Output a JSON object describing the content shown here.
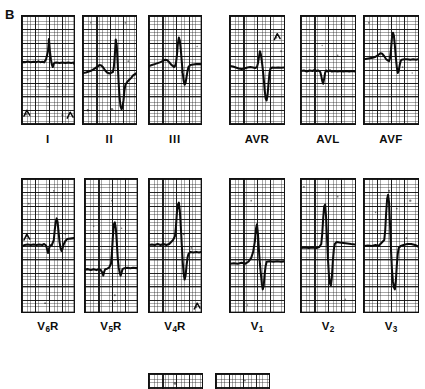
{
  "figure": {
    "panel_letter": "B",
    "background_color": "#ffffff",
    "ink_color": "#0b0b0b",
    "grid_major_color": "#111111",
    "grid_minor_color": "#282828",
    "width": 425,
    "height": 389,
    "caption_note": "Twelve-lead electrocardiogram strips, panel B"
  },
  "grid": {
    "major_cell_px": 13.4,
    "minor_cell_px": 2.7,
    "major_columns": 4,
    "major_rows": 8
  },
  "rows": [
    {
      "row_name": "standard-and-augmented-leads",
      "groups": [
        {
          "group_name": "standard-limb-leads",
          "panels": [
            {
              "id": "lead-I",
              "label": "I",
              "label_kind": "roman",
              "x": 21,
              "y": 15,
              "width": 54,
              "height": 110,
              "label_x": 21,
              "label_y": 133,
              "label_width": 54,
              "clipped": false,
              "trace": "M0,47 L3,47 L6,46.4 L9,47.2 L12,46.6 L15,47 L17,46.2 L19,47 L21,46.6 L23,47.2 L25,44 L26,40 L27,36 L28,23.5 L29,36 L30,44 L31,49.5 L32,52 L33,48.6 L34,47.6 L36,47.4 L39,47.8 L42,47.4 L45,47.8 L48,47.4 L51,47.8 L54,47.4 L54,47.8 L54,48.6 L54,48.6",
              "artifacts": [
                {
                  "cx": 4,
                  "cy": 100,
                  "r": 1.3
                },
                {
                  "cx": 42,
                  "cy": 101,
                  "r": 1.1
                },
                {
                  "cx": 6,
                  "cy": 65,
                  "r": 0.8
                },
                {
                  "cx": 27,
                  "cy": 72,
                  "r": 0.9
                }
              ],
              "corner_marks": [
                {
                  "type": "tick-bottom-left",
                  "x": 2,
                  "y": 96
                },
                {
                  "type": "tick-bottom-right",
                  "x": 47,
                  "y": 98
                }
              ]
            },
            {
              "id": "lead-II",
              "label": "II",
              "label_kind": "roman",
              "x": 82,
              "y": 15,
              "width": 55,
              "height": 110,
              "label_x": 82,
              "label_y": 133,
              "label_width": 55,
              "clipped": false,
              "trace": "M0,58 L3,57.5 L6,56.5 L9,55.5 L12,53.5 L15,51.5 L17,50 L19,50.5 L21,52.5 L23,55.5 L25,57.5 L27,58.5 L29,58 L31,57 L32,52 L33,40 L34,24 L35,30 L36,48 L37,68 L38,84 L39,92 L40,95 L41,93 L42,86 L43,76 L44,70 L46,67 L48,65 L50,63 L52,60.5 L55,58.5",
              "artifacts": [
                {
                  "cx": 5,
                  "cy": 96,
                  "r": 1.2
                },
                {
                  "cx": 30,
                  "cy": 95,
                  "r": 1.4
                },
                {
                  "cx": 47,
                  "cy": 46,
                  "r": 0.9
                },
                {
                  "cx": 8,
                  "cy": 7,
                  "r": 0.8
                },
                {
                  "cx": 44,
                  "cy": 7,
                  "r": 1.0
                }
              ],
              "corner_marks": []
            },
            {
              "id": "lead-III",
              "label": "III",
              "label_kind": "roman",
              "x": 148,
              "y": 15,
              "width": 54,
              "height": 110,
              "label_x": 148,
              "label_y": 133,
              "label_width": 54,
              "clipped": false,
              "trace": "M0,51 L3,50 L6,49 L9,48 L12,47 L15,45.5 L17,44.5 L19,45 L21,47 L23,49.5 L25,51 L26,52 L27,51 L28,48 L29,40 L30,28 L31,22 L32,25 L33,34 L34,46 L35,58 L36,66 L37,70 L38,68 L39,62 L40,56 L41,52 L43,50 L46,49.5 L49,49 L52,49 L54,49",
              "artifacts": [
                {
                  "cx": 34,
                  "cy": 57,
                  "r": 1.0
                },
                {
                  "cx": 42,
                  "cy": 56,
                  "r": 0.9
                },
                {
                  "cx": 50,
                  "cy": 31,
                  "r": 0.8
                }
              ],
              "corner_marks": []
            }
          ]
        },
        {
          "group_name": "augmented-limb-leads",
          "panels": [
            {
              "id": "lead-AVR",
              "label": "AVR",
              "label_kind": "plain",
              "x": 229,
              "y": 15,
              "width": 56,
              "height": 110,
              "label_x": 229,
              "label_y": 133,
              "label_width": 56,
              "clipped": false,
              "trace": "M0,51 L3,51.5 L6,52.5 L9,53.5 L12,54 L15,53.5 L18,52.5 L21,52 L24,52.5 L26,53 L28,52 L29,48 L30,42 L31,36 L32,39 L33,46 L34,54 L35,64 L36,76 L37,84 L38,86 L39,80 L40,68 L41,58 L42,53.5 L44,52.5 L47,52.8 L50,52.4 L53,52.8 L56,52.4",
              "artifacts": [
                {
                  "cx": 48,
                  "cy": 22,
                  "r": 1.1
                },
                {
                  "cx": 53,
                  "cy": 36,
                  "r": 1.0
                },
                {
                  "cx": 15,
                  "cy": 66,
                  "r": 0.8
                }
              ],
              "corner_marks": [
                {
                  "type": "tick-upper-right",
                  "x": 46,
                  "y": 18
                }
              ]
            },
            {
              "id": "lead-AVL",
              "label": "AVL",
              "label_kind": "plain",
              "x": 300,
              "y": 15,
              "width": 56,
              "height": 110,
              "label_x": 300,
              "label_y": 133,
              "label_width": 56,
              "clipped": false,
              "trace": "M0,56 L3,55.5 L6,56.5 L9,55.5 L12,56 L14,55 L16,56 L18,55.5 L20,57 L21,61 L22,66 L23,69 L24,64 L25,58 L26,55.5 L28,56.5 L30,55.5 L32,56.5 L35,56 L38,56.5 L41,56 L44,56.5 L47,56 L50,56.5 L53,56 L56,56.4",
              "artifacts": [
                {
                  "cx": 42,
                  "cy": 8,
                  "r": 0.9
                },
                {
                  "cx": 38,
                  "cy": 40,
                  "r": 0.8
                },
                {
                  "cx": 22,
                  "cy": 30,
                  "r": 0.7
                }
              ],
              "corner_marks": []
            },
            {
              "id": "lead-AVF",
              "label": "AVF",
              "label_kind": "plain",
              "x": 363,
              "y": 15,
              "width": 56,
              "height": 110,
              "label_x": 363,
              "label_y": 133,
              "label_width": 56,
              "clipped": false,
              "trace": "M0,44 L3,43.5 L6,43 L9,42.5 L12,41.5 L15,39.5 L17,38 L19,38.5 L21,41 L23,44 L25,45.5 L26,46 L27,43 L28,34 L29,22 L30,17 L31,20 L32,30 L33,42 L34,52 L35,58 L36,56 L37,50 L38,46 L39,44.5 L42,44 L45,44 L48,44.5 L51,44 L54,44.5 L56,44",
              "artifacts": [
                {
                  "cx": 5,
                  "cy": 7,
                  "r": 1.0
                },
                {
                  "cx": 40,
                  "cy": 52,
                  "r": 0.9
                },
                {
                  "cx": 50,
                  "cy": 58,
                  "r": 0.7
                }
              ],
              "corner_marks": []
            }
          ]
        }
      ]
    },
    {
      "row_name": "precordial-leads",
      "groups": [
        {
          "group_name": "right-precordial-leads",
          "panels": [
            {
              "id": "lead-V6R",
              "label_base": "V",
              "label_sub": "6",
              "label_suffix": "R",
              "label_kind": "subscript",
              "x": 21,
              "y": 178,
              "width": 54,
              "height": 135,
              "label_x": 21,
              "label_y": 320,
              "label_width": 54,
              "clipped": false,
              "trace": "M0,68 L3,67 L6,66.5 L9,67 L12,66.5 L15,67 L18,66.5 L21,67 L23,66 L25,67.5 L26,71 L27,75 L28,71 L29,67.5 L31,67 L33,62 L34,52 L35,44 L36,40 L37,44 L38,54 L39,64 L40,70 L41,73 L42,71 L43,67 L45,63 L47,61 L50,60.5 L54,60",
              "artifacts": [
                {
                  "cx": 7,
                  "cy": 25,
                  "r": 1.0
                },
                {
                  "cx": 33,
                  "cy": 12,
                  "r": 0.9
                },
                {
                  "cx": 45,
                  "cy": 56,
                  "r": 0.8
                },
                {
                  "cx": 24,
                  "cy": 126,
                  "r": 1.0
                },
                {
                  "cx": 5,
                  "cy": 58,
                  "r": 1.1
                }
              ],
              "corner_marks": [
                {
                  "type": "tick-mid-left",
                  "x": 2,
                  "y": 56
                }
              ]
            },
            {
              "id": "lead-V5R",
              "label_base": "V",
              "label_sub": "5",
              "label_suffix": "R",
              "label_kind": "subscript",
              "x": 84,
              "y": 178,
              "width": 54,
              "height": 135,
              "label_x": 84,
              "label_y": 320,
              "label_width": 54,
              "clipped": false,
              "trace": "M0,92 L3,91.5 L6,92.5 L9,91.5 L12,92.5 L14,91.5 L16,92 L18,95 L19,98 L20,94 L21,91.5 L23,91 L25,90 L27,86 L28,74 L29,58 L30,46 L31,44 L32,50 L33,64 L34,80 L35,90 L36,95 L37,98 L38,95 L39,91.5 L41,90.5 L44,90 L47,90.5 L50,90 L54,90.5",
              "artifacts": [
                {
                  "cx": 28,
                  "cy": 22,
                  "r": 0.9
                },
                {
                  "cx": 38,
                  "cy": 50,
                  "r": 0.8
                },
                {
                  "cx": 31,
                  "cy": 118,
                  "r": 1.1
                },
                {
                  "cx": 31,
                  "cy": 124,
                  "r": 1.0
                },
                {
                  "cx": 9,
                  "cy": 48,
                  "r": 0.8
                }
              ],
              "corner_marks": []
            },
            {
              "id": "lead-V4R",
              "label_base": "V",
              "label_sub": "4",
              "label_suffix": "R",
              "label_kind": "subscript",
              "x": 148,
              "y": 178,
              "width": 54,
              "height": 135,
              "label_x": 148,
              "label_y": 320,
              "label_width": 54,
              "clipped": false,
              "trace": "M0,67 L3,66.5 L6,67 L9,66 L12,67 L15,66 L18,67 L21,66 L23,64 L25,62 L27,58 L28,48 L29,34 L30,26 L31,24 L32,32 L33,48 L34,66 L35,84 L36,96 L37,102 L38,98 L39,88 L40,80 L41,76 L43,74 L46,74.5 L49,74 L52,74.5 L54,74",
              "artifacts": [
                {
                  "cx": 36,
                  "cy": 56,
                  "r": 1.0
                },
                {
                  "cx": 44,
                  "cy": 70,
                  "r": 0.9
                },
                {
                  "cx": 49,
                  "cy": 130,
                  "r": 1.2
                }
              ],
              "corner_marks": [
                {
                  "type": "tick-bottom-right",
                  "x": 47,
                  "y": 126
                }
              ]
            }
          ]
        },
        {
          "group_name": "left-precordial-leads",
          "panels": [
            {
              "id": "lead-V1",
              "label_base": "V",
              "label_sub": "1",
              "label_suffix": "",
              "label_kind": "subscript",
              "x": 229,
              "y": 178,
              "width": 56,
              "height": 135,
              "label_x": 229,
              "label_y": 320,
              "label_width": 56,
              "clipped": false,
              "trace": "M0,86 L4,85.5 L8,86 L12,85 L16,86 L19,84 L22,80 L24,74 L26,62 L27,50 L28,46 L29,56 L30,72 L31,86 L32,96 L33,106 L34,112 L35,108 L36,96 L37,88 L38,84 L41,83.5 L45,84 L49,83.5 L53,84 L56,83.6",
              "artifacts": [
                {
                  "cx": 22,
                  "cy": 22,
                  "r": 0.9
                },
                {
                  "cx": 25,
                  "cy": 62,
                  "r": 0.8
                },
                {
                  "cx": 18,
                  "cy": 128,
                  "r": 0.8
                }
              ],
              "corner_marks": []
            },
            {
              "id": "lead-V2",
              "label_base": "V",
              "label_sub": "2",
              "label_suffix": "",
              "label_kind": "subscript",
              "x": 300,
              "y": 178,
              "width": 56,
              "height": 135,
              "label_x": 300,
              "label_y": 320,
              "label_width": 56,
              "clipped": false,
              "trace": "M0,70 L4,69.5 L8,70 L12,69.5 L16,70 L19,69 L21,66 L22,56 L23,40 L24,28 L25,26 L26,38 L27,60 L28,82 L29,98 L30,106 L31,108 L32,100 L33,84 L34,72 L35,66 L37,64 L40,64.5 L44,65 L48,65.5 L52,66 L56,66.4",
              "artifacts": [
                {
                  "cx": 3,
                  "cy": 8,
                  "r": 1.0
                },
                {
                  "cx": 38,
                  "cy": 18,
                  "r": 0.9
                },
                {
                  "cx": 46,
                  "cy": 122,
                  "r": 0.8
                }
              ],
              "corner_marks": []
            },
            {
              "id": "lead-V3",
              "label_base": "V",
              "label_sub": "3",
              "label_suffix": "",
              "label_kind": "subscript",
              "x": 363,
              "y": 178,
              "width": 56,
              "height": 135,
              "label_x": 363,
              "label_y": 320,
              "label_width": 56,
              "clipped": false,
              "trace": "M0,68 L4,67.5 L8,68 L12,67 L15,68 L17,66 L19,64 L21,62 L22,52 L23,34 L24,20 L25,16 L26,24 L27,46 L28,72 L29,92 L30,104 L31,110 L32,112 L33,104 L34,88 L35,76 L36,70 L38,68 L41,67 L45,66 L49,66 L53,67 L56,68.5",
              "artifacts": [
                {
                  "cx": 26,
                  "cy": 12,
                  "r": 1.1
                },
                {
                  "cx": 34,
                  "cy": 30,
                  "r": 0.9
                },
                {
                  "cx": 48,
                  "cy": 22,
                  "r": 1.2
                },
                {
                  "cx": 12,
                  "cy": 34,
                  "r": 0.8
                },
                {
                  "cx": 44,
                  "cy": 60,
                  "r": 0.9
                }
              ],
              "corner_marks": []
            }
          ]
        }
      ]
    },
    {
      "row_name": "clipped-bottom-row",
      "groups": [
        {
          "group_name": "partially-visible-panels",
          "panels": [
            {
              "id": "clipped-panel-left",
              "label": "",
              "label_kind": "none",
              "x": 148,
              "y": 373,
              "width": 55,
              "height": 16,
              "label_x": 0,
              "label_y": 0,
              "label_width": 0,
              "clipped": true,
              "trace": "",
              "artifacts": [
                {
                  "cx": 27,
                  "cy": 10,
                  "r": 1.4
                }
              ],
              "corner_marks": []
            },
            {
              "id": "clipped-panel-right",
              "label": "",
              "label_kind": "none",
              "x": 215,
              "y": 373,
              "width": 55,
              "height": 16,
              "label_x": 0,
              "label_y": 0,
              "label_width": 0,
              "clipped": true,
              "trace": "",
              "artifacts": [
                {
                  "cx": 30,
                  "cy": 7,
                  "r": 1.0
                }
              ],
              "corner_marks": []
            }
          ]
        }
      ]
    }
  ]
}
